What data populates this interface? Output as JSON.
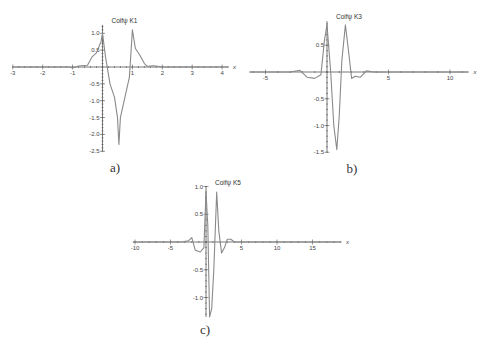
{
  "chart_data": [
    {
      "id": "a",
      "type": "line",
      "title": "Coifψ K1",
      "caption": "a)",
      "xlabel": "x",
      "ylabel": "",
      "xlim": [
        -3,
        4.2
      ],
      "ylim": [
        -2.5,
        1.25
      ],
      "x_ticks": [
        -3,
        -2,
        -1,
        1,
        2,
        3,
        4
      ],
      "y_ticks": [
        1.0,
        0.5,
        -0.5,
        -1.0,
        -1.5,
        -2.0,
        -2.5
      ],
      "grid": false,
      "series": [
        {
          "name": "Coifψ K1",
          "x": [
            -3,
            -1.1,
            -1.0,
            -0.8,
            -0.5,
            -0.35,
            -0.2,
            -0.05,
            0.0,
            0.1,
            0.25,
            0.4,
            0.5,
            0.55,
            0.6,
            0.75,
            0.9,
            1.0,
            1.1,
            1.25,
            1.4,
            1.5,
            1.7,
            1.85,
            2.0,
            4.2
          ],
          "y": [
            0,
            0,
            -0.03,
            0.03,
            0.05,
            0.3,
            0.42,
            0.75,
            1.0,
            0.3,
            -0.5,
            -0.9,
            -1.5,
            -2.3,
            -1.5,
            -0.9,
            -0.3,
            1.1,
            0.55,
            0.35,
            0.1,
            0.02,
            0.04,
            0.02,
            0,
            0
          ]
        }
      ]
    },
    {
      "id": "b",
      "type": "line",
      "title": "Coifψ K3",
      "caption": "b)",
      "xlabel": "x",
      "ylabel": "",
      "xlim": [
        -6.3,
        11.5
      ],
      "ylim": [
        -1.5,
        0.95
      ],
      "x_ticks": [
        -5,
        5,
        10
      ],
      "y_ticks": [
        0.5,
        -0.5,
        -1.0,
        -1.5
      ],
      "grid": false,
      "series": [
        {
          "name": "Coifψ K3",
          "x": [
            -6.3,
            -3.0,
            -2.2,
            -1.6,
            -1.0,
            -0.5,
            -0.2,
            0.0,
            0.3,
            0.55,
            0.8,
            1.0,
            1.2,
            1.5,
            1.8,
            2.0,
            2.3,
            2.7,
            3.2,
            3.8,
            11.5
          ],
          "y": [
            0,
            0,
            0.03,
            -0.1,
            -0.12,
            -0.05,
            0.6,
            0.88,
            0.0,
            -1.0,
            -1.45,
            -0.8,
            0.2,
            0.88,
            0.3,
            -0.12,
            -0.08,
            -0.1,
            0.02,
            0.0,
            0
          ]
        }
      ]
    },
    {
      "id": "c",
      "type": "line",
      "title": "Coifψ K5",
      "caption": "c)",
      "xlabel": "x",
      "ylabel": "",
      "xlim": [
        -10.3,
        19
      ],
      "ylim": [
        -1.35,
        1.0
      ],
      "x_ticks": [
        -10,
        -5,
        5,
        10,
        15
      ],
      "y_ticks": [
        1.0,
        0.5,
        -0.5,
        -1.0
      ],
      "grid": false,
      "series": [
        {
          "name": "Coifψ K5",
          "x": [
            -10.3,
            -3.5,
            -2.5,
            -2.0,
            -1.5,
            -0.8,
            -0.3,
            0.0,
            0.25,
            0.5,
            0.8,
            1.1,
            1.5,
            1.8,
            2.2,
            2.6,
            3.0,
            3.5,
            4.0,
            19
          ],
          "y": [
            0,
            0,
            0.02,
            0.08,
            -0.15,
            -0.18,
            -0.1,
            0.9,
            0.3,
            -1.35,
            -1.2,
            -0.5,
            0.9,
            0.2,
            -0.2,
            -0.1,
            0.05,
            0.05,
            0,
            0
          ]
        }
      ]
    }
  ],
  "layout": {
    "panels": [
      {
        "id": "a",
        "origin_px": [
          102.5,
          67
        ],
        "x_scale_px": 29.9,
        "y_scale_px": 33.7
      },
      {
        "id": "b",
        "origin_px": [
          327,
          72
        ],
        "x_scale_px": 12.3,
        "y_scale_px": 53.5
      },
      {
        "id": "c",
        "origin_px": [
          206,
          242
        ],
        "x_scale_px": 7.1,
        "y_scale_px": 55.5
      }
    ]
  }
}
